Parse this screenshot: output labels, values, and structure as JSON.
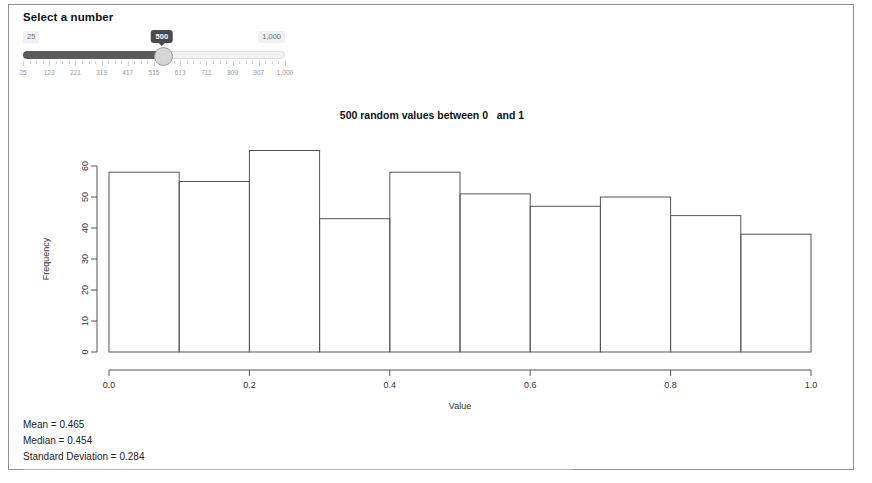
{
  "app": {
    "slider_panel_title": "Select a number",
    "slider": {
      "min_label": "25",
      "max_label": "1,000",
      "current_value_label": "500",
      "min": 25,
      "max": 1000,
      "value": 500,
      "tick_labels": [
        "25",
        "123",
        "221",
        "319",
        "417",
        "515",
        "613",
        "711",
        "809",
        "907",
        "1,000"
      ]
    }
  },
  "stats": {
    "mean_line": "Mean = 0.465",
    "median_line": "Median = 0.454",
    "sd_line": "Standard Deviation = 0.284"
  },
  "chart_data": {
    "type": "bar",
    "title": "500 random values between 0   and 1",
    "xlabel": "Value",
    "ylabel": "Frequency",
    "xlim": [
      0,
      1
    ],
    "ylim": [
      0,
      60
    ],
    "xticks": [
      "0.0",
      "0.2",
      "0.4",
      "0.6",
      "0.8",
      "1.0"
    ],
    "xtick_values": [
      0.0,
      0.2,
      0.4,
      0.6,
      0.8,
      1.0
    ],
    "yticks": [
      "0",
      "10",
      "20",
      "30",
      "40",
      "50",
      "60"
    ],
    "ytick_values": [
      0,
      10,
      20,
      30,
      40,
      50,
      60
    ],
    "grid": false,
    "legend": "none",
    "bin_edges": [
      0.0,
      0.1,
      0.2,
      0.3,
      0.4,
      0.5,
      0.6,
      0.7,
      0.8,
      0.9,
      1.0
    ],
    "categories": [
      "0.0-0.1",
      "0.1-0.2",
      "0.2-0.3",
      "0.3-0.4",
      "0.4-0.5",
      "0.5-0.6",
      "0.6-0.7",
      "0.7-0.8",
      "0.8-0.9",
      "0.9-1.0"
    ],
    "values": [
      58,
      55,
      65,
      43,
      58,
      51,
      47,
      50,
      44,
      38
    ]
  }
}
